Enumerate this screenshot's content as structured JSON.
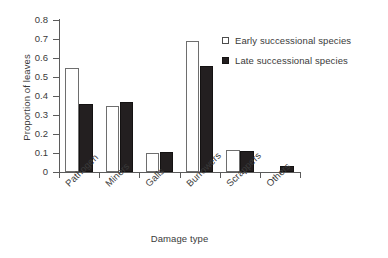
{
  "chart_data": {
    "type": "bar",
    "title": "",
    "xlabel": "Damage type",
    "ylabel": "Proportion of leaves",
    "categories": [
      "Pathogen",
      "Miners",
      "Galls",
      "Burrowers",
      "Scrappers",
      "Others"
    ],
    "series": [
      {
        "name": "Early successional species",
        "values": [
          0.545,
          0.345,
          0.102,
          0.69,
          0.115,
          0.0
        ],
        "color": "#ffffff"
      },
      {
        "name": "Late successional species",
        "values": [
          0.36,
          0.37,
          0.103,
          0.56,
          0.11,
          0.03
        ],
        "color": "#231f20"
      }
    ],
    "ylim": [
      0,
      0.8
    ],
    "yticks": [
      0,
      0.1,
      0.2,
      0.3,
      0.4,
      0.5,
      0.6,
      0.7,
      0.8
    ],
    "ytick_labels": [
      "0",
      "0.1",
      "0.2",
      "0.3",
      "0.4",
      "0.5",
      "0.6",
      "0.7",
      "0.8"
    ],
    "grid": false,
    "legend_position": "top-right",
    "xtick_rotation": -45
  },
  "axis": {
    "y_title": "Proportion of leaves",
    "x_title": "Damage type"
  },
  "legend": {
    "items": [
      {
        "label": "Early successional species",
        "swatch": "open-square-swatch"
      },
      {
        "label": "Late successional species",
        "swatch": "filled-square-swatch"
      }
    ]
  }
}
